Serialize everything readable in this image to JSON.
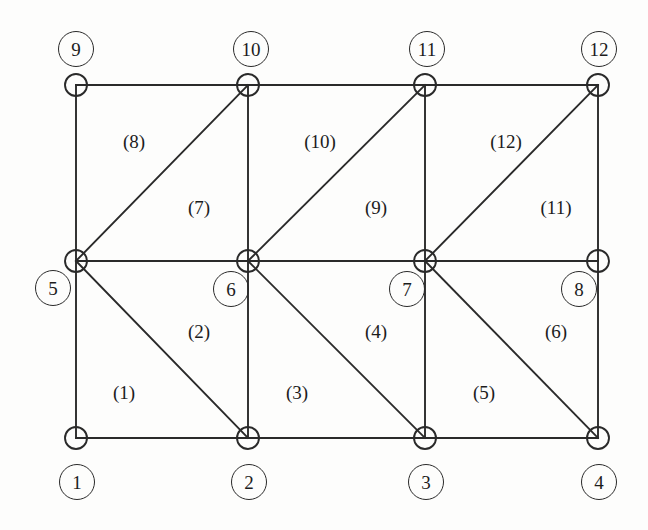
{
  "figure": {
    "background_color": "#fdfdfc",
    "line_color": "#2a2a2a",
    "text_color": "#1c1c1c"
  },
  "geometry": {
    "columns_x": [
      76,
      248,
      425,
      598
    ],
    "rows_y": [
      85,
      261,
      438
    ],
    "vertex_marker_radius": 11,
    "label_circle_radius": 17
  },
  "nodes": [
    {
      "id": "1",
      "label": "1",
      "vertex_x": 76,
      "vertex_y": 438,
      "label_x": 76,
      "label_y": 481
    },
    {
      "id": "2",
      "label": "2",
      "vertex_x": 248,
      "vertex_y": 438,
      "label_x": 248,
      "label_y": 481
    },
    {
      "id": "3",
      "label": "3",
      "vertex_x": 425,
      "vertex_y": 438,
      "label_x": 425,
      "label_y": 481
    },
    {
      "id": "4",
      "label": "4",
      "vertex_x": 598,
      "vertex_y": 438,
      "label_x": 598,
      "label_y": 481
    },
    {
      "id": "5",
      "label": "5",
      "vertex_x": 76,
      "vertex_y": 261,
      "label_x": 52,
      "label_y": 287
    },
    {
      "id": "6",
      "label": "6",
      "vertex_x": 248,
      "vertex_y": 261,
      "label_x": 230,
      "label_y": 288
    },
    {
      "id": "7",
      "label": "7",
      "vertex_x": 425,
      "vertex_y": 261,
      "label_x": 406,
      "label_y": 288
    },
    {
      "id": "8",
      "label": "8",
      "vertex_x": 598,
      "vertex_y": 261,
      "label_x": 578,
      "label_y": 288
    },
    {
      "id": "9",
      "label": "9",
      "vertex_x": 76,
      "vertex_y": 85,
      "label_x": 75,
      "label_y": 48
    },
    {
      "id": "10",
      "label": "10",
      "vertex_x": 248,
      "vertex_y": 85,
      "label_x": 250,
      "label_y": 48
    },
    {
      "id": "11",
      "label": "11",
      "vertex_x": 425,
      "vertex_y": 85,
      "label_x": 426,
      "label_y": 48
    },
    {
      "id": "12",
      "label": "12",
      "vertex_x": 598,
      "vertex_y": 85,
      "label_x": 598,
      "label_y": 48
    }
  ],
  "edges": [
    {
      "name": "bottom-edge-1-2",
      "x1": 76,
      "y1": 438,
      "x2": 248,
      "y2": 438
    },
    {
      "name": "bottom-edge-2-3",
      "x1": 248,
      "y1": 438,
      "x2": 425,
      "y2": 438
    },
    {
      "name": "bottom-edge-3-4",
      "x1": 425,
      "y1": 438,
      "x2": 598,
      "y2": 438
    },
    {
      "name": "middle-edge-5-6",
      "x1": 76,
      "y1": 261,
      "x2": 248,
      "y2": 261
    },
    {
      "name": "middle-edge-6-7",
      "x1": 248,
      "y1": 261,
      "x2": 425,
      "y2": 261
    },
    {
      "name": "middle-edge-7-8",
      "x1": 425,
      "y1": 261,
      "x2": 598,
      "y2": 261
    },
    {
      "name": "top-edge-9-10",
      "x1": 76,
      "y1": 85,
      "x2": 248,
      "y2": 85
    },
    {
      "name": "top-edge-10-11",
      "x1": 248,
      "y1": 85,
      "x2": 425,
      "y2": 85
    },
    {
      "name": "top-edge-11-12",
      "x1": 425,
      "y1": 85,
      "x2": 598,
      "y2": 85
    },
    {
      "name": "vertical-edge-1-5",
      "x1": 76,
      "y1": 438,
      "x2": 76,
      "y2": 261
    },
    {
      "name": "vertical-edge-2-6",
      "x1": 248,
      "y1": 438,
      "x2": 248,
      "y2": 261
    },
    {
      "name": "vertical-edge-3-7",
      "x1": 425,
      "y1": 438,
      "x2": 425,
      "y2": 261
    },
    {
      "name": "vertical-edge-4-8",
      "x1": 598,
      "y1": 438,
      "x2": 598,
      "y2": 261
    },
    {
      "name": "vertical-edge-5-9",
      "x1": 76,
      "y1": 261,
      "x2": 76,
      "y2": 85
    },
    {
      "name": "vertical-edge-6-10",
      "x1": 248,
      "y1": 261,
      "x2": 248,
      "y2": 85
    },
    {
      "name": "vertical-edge-7-11",
      "x1": 425,
      "y1": 261,
      "x2": 425,
      "y2": 85
    },
    {
      "name": "vertical-edge-8-12",
      "x1": 598,
      "y1": 261,
      "x2": 598,
      "y2": 85
    },
    {
      "name": "diagonal-edge-5-2",
      "x1": 76,
      "y1": 261,
      "x2": 248,
      "y2": 438
    },
    {
      "name": "diagonal-edge-6-3",
      "x1": 248,
      "y1": 261,
      "x2": 425,
      "y2": 438
    },
    {
      "name": "diagonal-edge-7-4",
      "x1": 425,
      "y1": 261,
      "x2": 598,
      "y2": 438
    },
    {
      "name": "diagonal-edge-5-10",
      "x1": 76,
      "y1": 261,
      "x2": 248,
      "y2": 85
    },
    {
      "name": "diagonal-edge-6-11",
      "x1": 248,
      "y1": 261,
      "x2": 425,
      "y2": 85
    },
    {
      "name": "diagonal-edge-7-12",
      "x1": 425,
      "y1": 261,
      "x2": 598,
      "y2": 85
    }
  ],
  "elements": [
    {
      "id": "1",
      "label": "(1)",
      "x": 124,
      "y": 392,
      "nodes": [
        "1",
        "2",
        "5"
      ]
    },
    {
      "id": "2",
      "label": "(2)",
      "x": 199,
      "y": 331,
      "nodes": [
        "2",
        "6",
        "5"
      ]
    },
    {
      "id": "3",
      "label": "(3)",
      "x": 297,
      "y": 392,
      "nodes": [
        "2",
        "3",
        "6"
      ]
    },
    {
      "id": "4",
      "label": "(4)",
      "x": 376,
      "y": 331,
      "nodes": [
        "3",
        "7",
        "6"
      ]
    },
    {
      "id": "5",
      "label": "(5)",
      "x": 484,
      "y": 392,
      "nodes": [
        "3",
        "4",
        "7"
      ]
    },
    {
      "id": "6",
      "label": "(6)",
      "x": 556,
      "y": 331,
      "nodes": [
        "4",
        "8",
        "7"
      ]
    },
    {
      "id": "7",
      "label": "(7)",
      "x": 199,
      "y": 207,
      "nodes": [
        "5",
        "6",
        "10"
      ]
    },
    {
      "id": "8",
      "label": "(8)",
      "x": 134,
      "y": 141,
      "nodes": [
        "5",
        "10",
        "9"
      ]
    },
    {
      "id": "9",
      "label": "(9)",
      "x": 376,
      "y": 207,
      "nodes": [
        "6",
        "7",
        "11"
      ]
    },
    {
      "id": "10",
      "label": "(10)",
      "x": 320,
      "y": 141,
      "nodes": [
        "6",
        "11",
        "10"
      ]
    },
    {
      "id": "11",
      "label": "(11)",
      "x": 556,
      "y": 207,
      "nodes": [
        "7",
        "8",
        "12"
      ]
    },
    {
      "id": "12",
      "label": "(12)",
      "x": 506,
      "y": 141,
      "nodes": [
        "7",
        "12",
        "11"
      ]
    }
  ]
}
